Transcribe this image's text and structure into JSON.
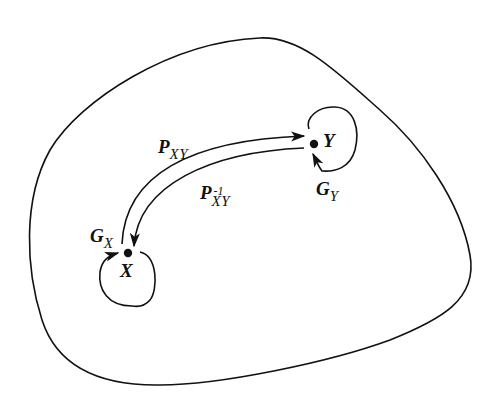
{
  "diagram": {
    "type": "transport/loop diagram",
    "nodes": [
      {
        "id": "X",
        "label": "X"
      },
      {
        "id": "Y",
        "label": "Y"
      }
    ],
    "labels": {
      "p_xy": {
        "main": "P",
        "sub": "XY"
      },
      "p_xy_inv": {
        "main": "P",
        "sup": "-1",
        "sub": "XY"
      },
      "g_x": {
        "main": "G",
        "sub": "X"
      },
      "g_y": {
        "main": "G",
        "sub": "Y"
      }
    },
    "edges": [
      {
        "from": "X",
        "to": "Y",
        "label": "P_XY"
      },
      {
        "from": "Y",
        "to": "X",
        "label": "P_XY^-1"
      },
      {
        "from": "X",
        "to": "X",
        "label": "G_X"
      },
      {
        "from": "Y",
        "to": "Y",
        "label": "G_Y"
      }
    ],
    "colors": {
      "stroke": "#111111",
      "background": "#ffffff"
    }
  }
}
